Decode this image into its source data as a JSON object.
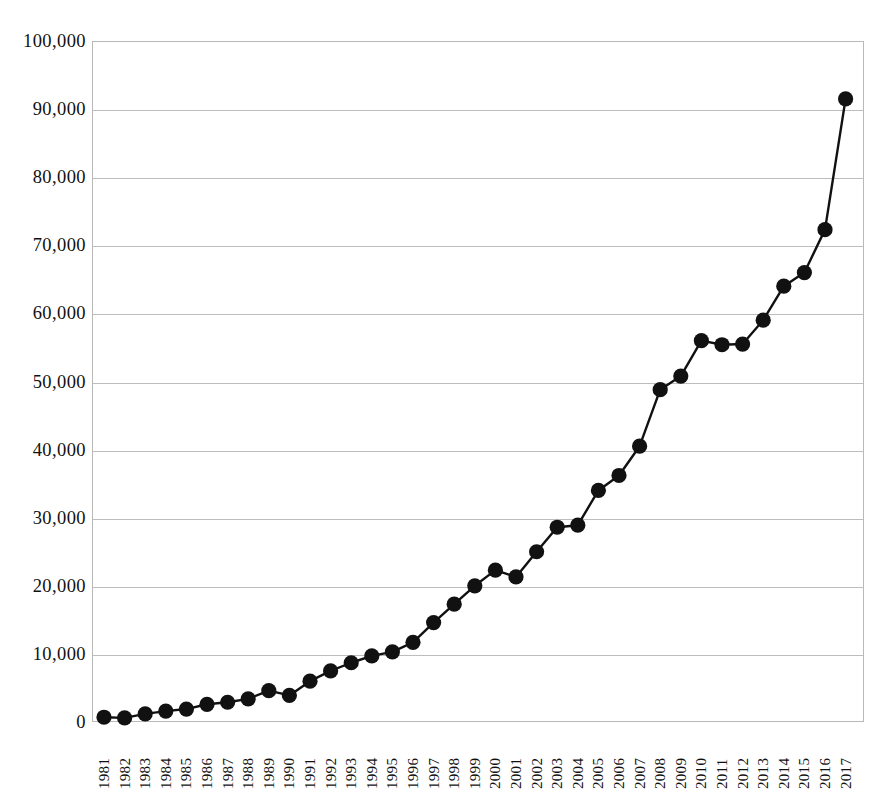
{
  "chart_data": {
    "type": "line",
    "title": "",
    "subtitle": "",
    "xlabel": "",
    "ylabel": "",
    "ylim": [
      0,
      100000
    ],
    "xlim": [
      "1981",
      "2017"
    ],
    "grid": true,
    "legend": false,
    "marker": "filled-circle",
    "line_color": "#111111",
    "marker_color": "#111111",
    "grid_color": "#bdbdbd",
    "y_ticks": [
      "0",
      "10,000",
      "20,000",
      "30,000",
      "40,000",
      "50,000",
      "60,000",
      "70,000",
      "80,000",
      "90,000",
      "100,000"
    ],
    "y_tick_values": [
      0,
      10000,
      20000,
      30000,
      40000,
      50000,
      60000,
      70000,
      80000,
      90000,
      100000
    ],
    "categories": [
      "1981",
      "1982",
      "1983",
      "1984",
      "1985",
      "1986",
      "1987",
      "1988",
      "1989",
      "1990",
      "1991",
      "1992",
      "1993",
      "1994",
      "1995",
      "1996",
      "1997",
      "1998",
      "1999",
      "2000",
      "2001",
      "2002",
      "2003",
      "2004",
      "2005",
      "2006",
      "2007",
      "2008",
      "2009",
      "2010",
      "2011",
      "2012",
      "2013",
      "2014",
      "2015",
      "2016",
      "2017"
    ],
    "values": [
      700,
      600,
      1200,
      1600,
      1900,
      2600,
      2900,
      3400,
      4600,
      3900,
      6000,
      7500,
      8700,
      9700,
      10300,
      11700,
      14600,
      17300,
      20000,
      22300,
      21300,
      25000,
      28600,
      28900,
      34000,
      36200,
      40500,
      48800,
      50800,
      56000,
      55400,
      55500,
      59000,
      64000,
      66000,
      72300,
      91500
    ],
    "series": [
      {
        "name": "series-1",
        "values": [
          700,
          600,
          1200,
          1600,
          1900,
          2600,
          2900,
          3400,
          4600,
          3900,
          6000,
          7500,
          8700,
          9700,
          10300,
          11700,
          14600,
          17300,
          20000,
          22300,
          21300,
          25000,
          28600,
          28900,
          34000,
          36200,
          40500,
          48800,
          50800,
          56000,
          55400,
          55500,
          59000,
          64000,
          66000,
          72300,
          91500
        ]
      }
    ]
  }
}
